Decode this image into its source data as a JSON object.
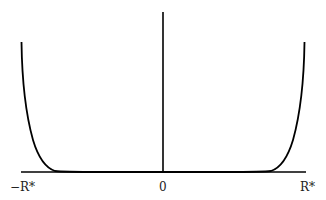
{
  "figure": {
    "axis_labels": {
      "left": "−R*",
      "center": "0",
      "right": "R*"
    },
    "colors": {
      "stroke": "#000000",
      "background": "#ffffff",
      "label": "#222222"
    }
  }
}
